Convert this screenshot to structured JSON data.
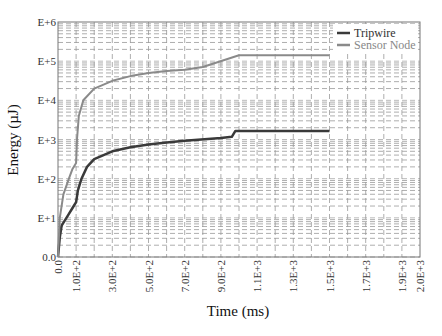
{
  "chart_data": {
    "type": "line",
    "title": "",
    "xlabel": "Time (ms)",
    "ylabel": "Energy (µJ)",
    "xlim": [
      0,
      2000
    ],
    "ylim_decades": [
      "0.0",
      "E+1",
      "E+2",
      "E+3",
      "E+4",
      "E+5",
      "E+6"
    ],
    "yscale": "log",
    "grid": true,
    "legend_position": "upper right",
    "x_ticks": [
      "0.0",
      "1.0E+2",
      "3.0E+2",
      "5.0E+2",
      "7.0E+2",
      "9.0E+2",
      "1.1E+3",
      "1.3E+3",
      "1.5E+3",
      "1.7E+3",
      "1.9E+3",
      "2.0E+3"
    ],
    "x_tick_values": [
      0,
      100,
      300,
      500,
      700,
      900,
      1100,
      1300,
      1500,
      1700,
      1900,
      2000
    ],
    "y_ticks": [
      "0.0",
      "E+1",
      "E+2",
      "E+3",
      "E+4",
      "E+5",
      "E+6"
    ],
    "series": [
      {
        "name": "Tripwire",
        "color": "#3a3a3a",
        "points_log10": [
          [
            0,
            0
          ],
          [
            10,
            0.5
          ],
          [
            20,
            0.8
          ],
          [
            40,
            0.95
          ],
          [
            60,
            1.1
          ],
          [
            80,
            1.25
          ],
          [
            100,
            1.4
          ],
          [
            110,
            1.7
          ],
          [
            130,
            2.0
          ],
          [
            160,
            2.3
          ],
          [
            200,
            2.5
          ],
          [
            300,
            2.7
          ],
          [
            400,
            2.8
          ],
          [
            500,
            2.87
          ],
          [
            600,
            2.92
          ],
          [
            700,
            2.97
          ],
          [
            900,
            3.04
          ],
          [
            960,
            3.07
          ],
          [
            980,
            3.22
          ],
          [
            1500,
            3.22
          ]
        ]
      },
      {
        "name": "Sensor Node",
        "color": "#8a8a8a",
        "points_log10": [
          [
            0,
            0
          ],
          [
            10,
            1.0
          ],
          [
            30,
            1.6
          ],
          [
            60,
            2.0
          ],
          [
            80,
            2.25
          ],
          [
            100,
            2.4
          ],
          [
            105,
            3.0
          ],
          [
            115,
            3.6
          ],
          [
            140,
            4.0
          ],
          [
            200,
            4.3
          ],
          [
            300,
            4.5
          ],
          [
            400,
            4.62
          ],
          [
            500,
            4.7
          ],
          [
            600,
            4.75
          ],
          [
            700,
            4.78
          ],
          [
            800,
            4.85
          ],
          [
            1000,
            5.15
          ],
          [
            1500,
            5.15
          ]
        ]
      }
    ]
  },
  "legend": {
    "items": [
      {
        "label": "Tripwire",
        "color": "#3a3a3a"
      },
      {
        "label": "Sensor Node",
        "color": "#8a8a8a"
      }
    ]
  }
}
